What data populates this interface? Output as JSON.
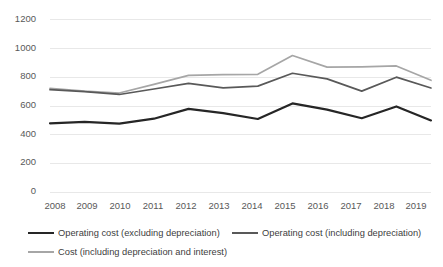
{
  "chart_data": {
    "type": "line",
    "title": "",
    "xlabel": "",
    "ylabel": "",
    "categories": [
      "2008",
      "2009",
      "2010",
      "2011",
      "2012",
      "2013",
      "2014",
      "2015",
      "2016",
      "2017",
      "2018",
      "2019"
    ],
    "ylim": [
      0,
      1200
    ],
    "y_ticks": [
      0,
      200,
      400,
      600,
      800,
      1000,
      1200
    ],
    "grid": true,
    "legend_position": "bottom",
    "series": [
      {
        "name": "Operating cost (excluding depreciation)",
        "color": "#262626",
        "values": [
          480,
          490,
          478,
          512,
          580,
          550,
          510,
          618,
          575,
          515,
          597,
          500
        ]
      },
      {
        "name": "Operating cost (including depreciation)",
        "color": "#595959",
        "values": [
          713,
          700,
          680,
          718,
          757,
          726,
          738,
          827,
          788,
          703,
          800,
          725
        ]
      },
      {
        "name": "Cost (including depreciation and interest)",
        "color": "#a6a6a6",
        "values": [
          722,
          703,
          690,
          750,
          812,
          818,
          820,
          950,
          870,
          872,
          878,
          778
        ]
      }
    ],
    "gridline_color": "#e8e8e8",
    "tick_label_color": "#595959"
  },
  "axis": {
    "y_tick_labels": [
      "1200",
      "1000",
      "800",
      "600",
      "400",
      "200",
      "0"
    ],
    "x_tick_labels": [
      "2008",
      "2009",
      "2010",
      "2011",
      "2012",
      "2013",
      "2014",
      "2015",
      "2016",
      "2017",
      "2018",
      "2019"
    ]
  },
  "legend": {
    "items": [
      {
        "label": "Operating cost (excluding depreciation)",
        "color": "#262626"
      },
      {
        "label": "Operating cost (including depreciation)",
        "color": "#595959"
      },
      {
        "label": "Cost (including depreciation and interest)",
        "color": "#a6a6a6"
      }
    ]
  }
}
